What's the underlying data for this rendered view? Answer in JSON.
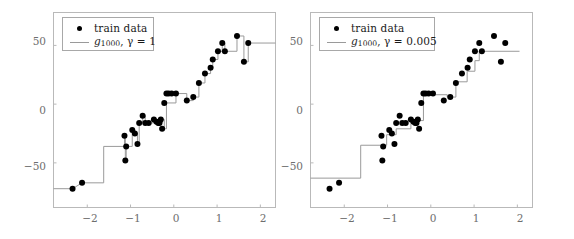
{
  "figure": {
    "width": 574,
    "height": 239,
    "background": "#ffffff",
    "frame_color": "#b9b9b9",
    "point_color": "#000000",
    "line_color": "#9a9a9a",
    "tick_label_color": "#6e6e6e"
  },
  "chart_data": [
    {
      "type": "scatter",
      "panel": "left",
      "title": "",
      "xlabel": "",
      "ylabel": "",
      "xlim": [
        -2.78,
        2.35
      ],
      "ylim": [
        -88,
        78
      ],
      "xticks": [
        -2,
        -1,
        0,
        1,
        2
      ],
      "xticklabels": [
        "−2",
        "−1",
        "0",
        "1",
        "2"
      ],
      "yticks": [
        -50,
        0,
        50
      ],
      "yticklabels": [
        "−50",
        "0",
        "50"
      ],
      "grid": false,
      "legend_position": "upper left",
      "legend": [
        {
          "label": "train data",
          "marker": "dot"
        },
        {
          "label": "g_1000, γ = 1",
          "marker": "line",
          "base": "g",
          "subscript": "1000",
          "gamma_value": "1"
        }
      ],
      "series": [
        {
          "name": "train data",
          "marker": "dot",
          "x": [
            -2.34,
            -2.12,
            -1.14,
            -1.12,
            -1.1,
            -0.96,
            -0.9,
            -0.84,
            -0.8,
            -0.72,
            -0.66,
            -0.58,
            -0.46,
            -0.4,
            -0.36,
            -0.33,
            -0.3,
            -0.27,
            -0.22,
            -0.17,
            -0.12,
            -0.05,
            0.05,
            0.3,
            0.45,
            0.58,
            0.72,
            0.85,
            0.9,
            1.02,
            1.12,
            1.18,
            1.46,
            1.62,
            1.72
          ],
          "y": [
            -72,
            -67,
            -27,
            -48,
            -36,
            -22,
            -25,
            -34,
            -16,
            -10,
            -16,
            -16,
            -13,
            -15,
            -16,
            -16,
            -13,
            -21,
            1,
            9,
            9,
            9,
            9,
            3,
            6,
            18,
            26,
            31,
            38,
            45,
            52,
            45,
            58,
            36,
            52
          ]
        },
        {
          "name": "g_1000 step fit (gamma = 1)",
          "marker": "step",
          "x": [
            -2.78,
            -2.34,
            -2.12,
            -1.62,
            -1.62,
            -1.14,
            -1.14,
            -1.12,
            -1.12,
            -1.1,
            -1.1,
            -0.96,
            -0.96,
            -0.9,
            -0.9,
            -0.84,
            -0.84,
            -0.8,
            -0.8,
            -0.72,
            -0.72,
            -0.66,
            -0.66,
            -0.46,
            -0.46,
            -0.4,
            -0.4,
            -0.33,
            -0.33,
            -0.27,
            -0.27,
            -0.22,
            -0.22,
            -0.17,
            -0.17,
            0.05,
            0.05,
            0.3,
            0.3,
            0.45,
            0.45,
            0.58,
            0.58,
            0.72,
            0.72,
            0.85,
            0.85,
            0.9,
            0.9,
            1.02,
            1.02,
            1.12,
            1.12,
            1.18,
            1.18,
            1.46,
            1.46,
            1.62,
            1.62,
            1.72,
            1.72,
            2.35
          ],
          "y": [
            -72,
            -72,
            -67,
            -67,
            -36,
            -36,
            -27,
            -27,
            -48,
            -48,
            -36,
            -36,
            -22,
            -22,
            -25,
            -25,
            -34,
            -34,
            -16,
            -16,
            -10,
            -10,
            -16,
            -16,
            -13,
            -13,
            -15,
            -15,
            -16,
            -16,
            -13,
            -13,
            -21,
            -21,
            1,
            1,
            9,
            9,
            3,
            3,
            6,
            6,
            18,
            18,
            26,
            26,
            31,
            31,
            38,
            38,
            45,
            45,
            52,
            52,
            45,
            45,
            58,
            58,
            36,
            36,
            52,
            52
          ]
        }
      ]
    },
    {
      "type": "scatter",
      "panel": "right",
      "title": "",
      "xlabel": "",
      "ylabel": "",
      "xlim": [
        -2.78,
        2.35
      ],
      "ylim": [
        -88,
        78
      ],
      "xticks": [
        -2,
        -1,
        0,
        1,
        2
      ],
      "xticklabels": [
        "−2",
        "−1",
        "0",
        "1",
        "2"
      ],
      "yticks": [
        -50,
        0,
        50
      ],
      "yticklabels": [
        "−50",
        "0",
        "50"
      ],
      "grid": false,
      "legend_position": "upper left",
      "legend": [
        {
          "label": "train data",
          "marker": "dot"
        },
        {
          "label": "g_1000, γ = 0.005",
          "marker": "line",
          "base": "g",
          "subscript": "1000",
          "gamma_value": "0.005"
        }
      ],
      "series": [
        {
          "name": "train data",
          "marker": "dot",
          "x": [
            -2.34,
            -2.12,
            -1.14,
            -1.12,
            -1.1,
            -0.96,
            -0.9,
            -0.84,
            -0.8,
            -0.72,
            -0.66,
            -0.58,
            -0.46,
            -0.4,
            -0.36,
            -0.33,
            -0.3,
            -0.27,
            -0.22,
            -0.17,
            -0.12,
            -0.05,
            0.05,
            0.3,
            0.45,
            0.58,
            0.72,
            0.85,
            0.9,
            1.02,
            1.12,
            1.18,
            1.46,
            1.62,
            1.72
          ],
          "y": [
            -72,
            -67,
            -27,
            -48,
            -36,
            -22,
            -25,
            -34,
            -16,
            -10,
            -16,
            -16,
            -13,
            -15,
            -16,
            -16,
            -13,
            -21,
            1,
            9,
            9,
            9,
            9,
            3,
            6,
            18,
            26,
            31,
            38,
            45,
            52,
            45,
            58,
            36,
            52
          ]
        },
        {
          "name": "g_1000 step fit (gamma = 0.005)",
          "marker": "step",
          "x": [
            -2.78,
            -1.62,
            -1.62,
            -1.02,
            -1.02,
            -0.8,
            -0.8,
            -0.46,
            -0.46,
            -0.17,
            -0.17,
            0.38,
            0.38,
            0.58,
            0.58,
            0.84,
            0.84,
            1.02,
            1.02,
            1.12,
            1.12,
            2.05
          ],
          "y": [
            -63,
            -63,
            -35,
            -35,
            -26,
            -26,
            -21,
            -21,
            -14,
            -14,
            8,
            8,
            6,
            6,
            19,
            19,
            28,
            28,
            37,
            37,
            45,
            45
          ]
        }
      ]
    }
  ],
  "panels": [
    {
      "id": "left",
      "legend": {
        "entry1": "train data",
        "entry2_base": "g",
        "entry2_sub": "1000",
        "entry2_tail": ", γ = 1"
      },
      "yticklabels": [
        "50",
        "0",
        "−50"
      ],
      "xticklabels": [
        "−2",
        "−1",
        "0",
        "1",
        "2"
      ]
    },
    {
      "id": "right",
      "legend": {
        "entry1": "train data",
        "entry2_base": "g",
        "entry2_sub": "1000",
        "entry2_tail": ", γ = 0.005"
      },
      "yticklabels": [
        "50",
        "0",
        "−50"
      ],
      "xticklabels": [
        "−2",
        "−1",
        "0",
        "1",
        "2"
      ]
    }
  ]
}
